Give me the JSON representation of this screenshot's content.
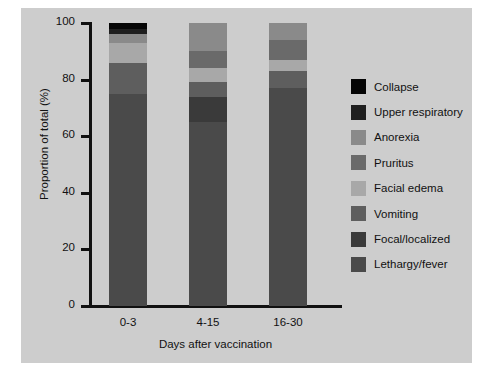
{
  "figure": {
    "background": "#cdcdcd",
    "page_background": "#ffffff"
  },
  "chart_data": {
    "type": "bar",
    "subtype": "stacked-100-percent",
    "title": "",
    "xlabel": "Days after vaccination",
    "ylabel": "Proportion of total (%)",
    "categories": [
      "0-3",
      "4-15",
      "16-30"
    ],
    "ylim": [
      0,
      100
    ],
    "yticks": [
      0,
      20,
      40,
      60,
      80,
      100
    ],
    "ytick_labels": [
      "0",
      "20",
      "40",
      "60",
      "80",
      "100"
    ],
    "grid": false,
    "legend_position": "right",
    "stack_order_top_to_bottom": [
      "Collapse",
      "Upper respiratory",
      "Anorexia",
      "Pruritus",
      "Facial edema",
      "Vomiting",
      "Focal/localized",
      "Lethargy/fever"
    ],
    "series": [
      {
        "name": "Collapse",
        "color": "#050505",
        "values": [
          2,
          0,
          0
        ]
      },
      {
        "name": "Upper respiratory",
        "color": "#1f1f1f",
        "values": [
          2,
          0,
          0
        ]
      },
      {
        "name": "Anorexia",
        "color": "#8a8a8a",
        "values": [
          3,
          10,
          6
        ]
      },
      {
        "name": "Pruritus",
        "color": "#6a6a6a",
        "values": [
          0,
          6,
          7
        ]
      },
      {
        "name": "Facial edema",
        "color": "#a8a8a8",
        "values": [
          7,
          5,
          4
        ]
      },
      {
        "name": "Vomiting",
        "color": "#5e5e5e",
        "values": [
          11,
          5,
          6
        ]
      },
      {
        "name": "Focal/localized",
        "color": "#3a3a3a",
        "values": [
          0,
          9,
          0
        ]
      },
      {
        "name": "Lethargy/fever",
        "color": "#4a4a4a",
        "values": [
          75,
          65,
          77
        ]
      }
    ]
  },
  "legend": {
    "items": [
      {
        "label": "Collapse",
        "color": "#050505"
      },
      {
        "label": "Upper respiratory",
        "color": "#1f1f1f"
      },
      {
        "label": "Anorexia",
        "color": "#8a8a8a"
      },
      {
        "label": "Pruritus",
        "color": "#6a6a6a"
      },
      {
        "label": "Facial edema",
        "color": "#a8a8a8"
      },
      {
        "label": "Vomiting",
        "color": "#5e5e5e"
      },
      {
        "label": "Focal/localized",
        "color": "#3a3a3a"
      },
      {
        "label": "Lethargy/fever",
        "color": "#4a4a4a"
      }
    ]
  }
}
